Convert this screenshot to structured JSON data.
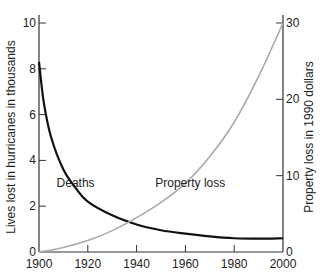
{
  "chart_data": {
    "type": "line",
    "title": "",
    "xlabel": "",
    "ylabel": "Lives lost in hurricanes in thousands",
    "y2label": "Property loss in 1990 dollars",
    "xlim": [
      1900,
      2000
    ],
    "ylim": [
      0,
      10
    ],
    "y2lim": [
      0,
      30
    ],
    "x_ticks": [
      1900,
      1920,
      1940,
      1960,
      1980,
      2000
    ],
    "y_ticks": [
      0,
      2,
      4,
      6,
      8,
      10
    ],
    "y2_ticks": [
      0,
      10,
      20,
      30
    ],
    "grid": false,
    "legend": "inline labels",
    "series": [
      {
        "name": "Deaths",
        "axis": "left",
        "color": "#111111",
        "x": [
          1900,
          1902,
          1905,
          1910,
          1915,
          1920,
          1930,
          1940,
          1950,
          1960,
          1970,
          1980,
          1990,
          2000
        ],
        "values": [
          8.3,
          6.5,
          5.0,
          3.6,
          2.8,
          2.2,
          1.6,
          1.2,
          0.95,
          0.8,
          0.68,
          0.6,
          0.58,
          0.6
        ]
      },
      {
        "name": "Property loss",
        "axis": "right",
        "color": "#aaaaaa",
        "x": [
          1900,
          1910,
          1920,
          1930,
          1940,
          1950,
          1960,
          1970,
          1980,
          1990,
          2000
        ],
        "values": [
          0,
          0.6,
          1.5,
          2.8,
          4.5,
          6.5,
          9,
          12.5,
          17,
          23,
          30
        ]
      }
    ],
    "annotations": [
      {
        "text": "Deaths",
        "x": 1915,
        "y": 3.0
      },
      {
        "text": "Property loss",
        "x": 1962,
        "y": 3.0
      }
    ]
  }
}
